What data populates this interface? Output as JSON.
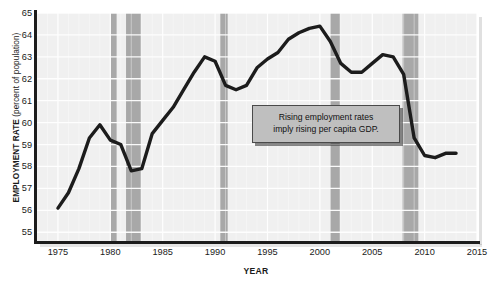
{
  "chart_data": {
    "type": "line",
    "title": "",
    "xlabel": "YEAR",
    "ylabel": "EMPLOYMENT RATE (percent of population)",
    "ylabel_main": "EMPLOYMENT RATE",
    "ylabel_sub": " (percent of population)",
    "xlim": [
      1973,
      2015
    ],
    "ylim": [
      54.6,
      65
    ],
    "grid": true,
    "legend": "none",
    "xticks": [
      1975,
      1980,
      1985,
      1990,
      1995,
      2000,
      2005,
      2010,
      2015
    ],
    "yticks": [
      55,
      56,
      57,
      58,
      59,
      60,
      61,
      62,
      63,
      64,
      65
    ],
    "line_color": "#1c1c1c",
    "plot_bg": "#f0f0f0",
    "grid_color": "#ffffff",
    "recession_color": "#a8a8a8",
    "series": [
      {
        "name": "Employment rate",
        "x": [
          1975,
          1976,
          1977,
          1978,
          1979,
          1980,
          1981,
          1982,
          1983,
          1984,
          1985,
          1986,
          1987,
          1988,
          1989,
          1990,
          1991,
          1992,
          1993,
          1994,
          1995,
          1996,
          1997,
          1998,
          1999,
          2000,
          2001,
          2002,
          2003,
          2004,
          2005,
          2006,
          2007,
          2008,
          2009,
          2010,
          2011,
          2012,
          2013
        ],
        "values": [
          56.1,
          56.8,
          57.9,
          59.3,
          59.9,
          59.2,
          59.0,
          57.8,
          57.9,
          59.5,
          60.1,
          60.7,
          61.5,
          62.3,
          63.0,
          62.8,
          61.7,
          61.5,
          61.7,
          62.5,
          62.9,
          63.2,
          63.8,
          64.1,
          64.3,
          64.4,
          63.7,
          62.7,
          62.3,
          62.3,
          62.7,
          63.1,
          63.0,
          62.2,
          59.3,
          58.5,
          58.4,
          58.6,
          58.6
        ]
      }
    ],
    "recession_bands": [
      {
        "start": 1980.0,
        "end": 1980.6
      },
      {
        "start": 1981.5,
        "end": 1982.9
      },
      {
        "start": 1990.5,
        "end": 1991.2
      },
      {
        "start": 2001.0,
        "end": 2001.9
      },
      {
        "start": 2007.9,
        "end": 2009.4
      }
    ]
  },
  "annotation": {
    "line1": "Rising employment rates",
    "line2": "imply rising per capita GDP."
  }
}
